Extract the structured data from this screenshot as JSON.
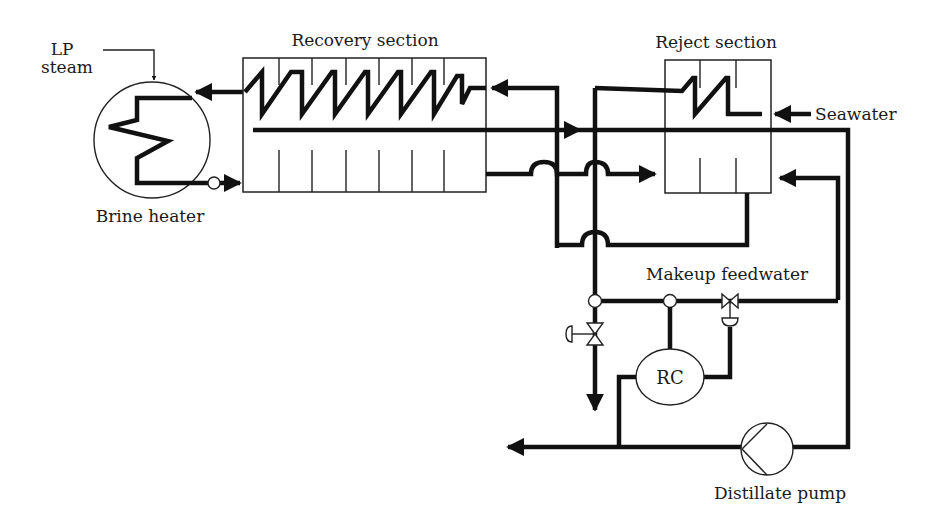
{
  "diagram": {
    "labels": {
      "lp_steam_line1": "LP",
      "lp_steam_line2": "steam",
      "brine_heater": "Brine heater",
      "recovery_section": "Recovery section",
      "reject_section": "Reject section",
      "seawater": "Seawater",
      "makeup_feedwater": "Makeup feedwater",
      "controller": "RC",
      "distillate_pump": "Distillate pump"
    },
    "components": [
      {
        "id": "brine-heater",
        "type": "heat-exchanger",
        "label": "Brine heater"
      },
      {
        "id": "recovery-section",
        "type": "multi-stage-flash",
        "label": "Recovery section",
        "stages": 7
      },
      {
        "id": "reject-section",
        "type": "multi-stage-flash",
        "label": "Reject section",
        "stages": 3
      },
      {
        "id": "rc-controller",
        "type": "controller",
        "label": "RC"
      },
      {
        "id": "control-valve",
        "type": "control-valve"
      },
      {
        "id": "manual-valve",
        "type": "manual-valve"
      },
      {
        "id": "distillate-pump",
        "type": "pump",
        "label": "Distillate pump"
      }
    ],
    "colors": {
      "line": "#111111",
      "background": "#ffffff"
    }
  }
}
